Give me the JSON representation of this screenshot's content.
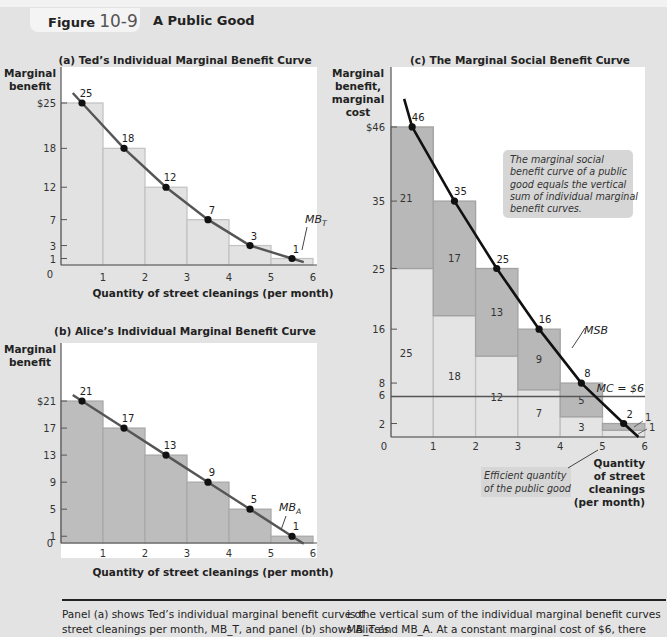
{
  "header": {
    "figure_label": "Figure",
    "figure_number": "10-9",
    "figure_title": "A Public Good"
  },
  "chart_data": [
    {
      "id": "a",
      "type": "bar",
      "title": "(a) Ted’s Individual Marginal Benefit Curve",
      "ylabel": "Marginal benefit",
      "xlabel": "Quantity of street cleanings (per month)",
      "categories": [
        "1",
        "2",
        "3",
        "4",
        "5",
        "6"
      ],
      "x_ticks": [
        0,
        1,
        2,
        3,
        4,
        5,
        6
      ],
      "y_ticks": [
        "$25",
        "18",
        "12",
        "7",
        "3",
        "1"
      ],
      "values": [
        25,
        18,
        12,
        7,
        3,
        1
      ],
      "curve_label": "MB_T",
      "ylim": [
        0,
        28
      ],
      "xlim": [
        0,
        6
      ]
    },
    {
      "id": "b",
      "type": "bar",
      "title": "(b) Alice’s Individual Marginal Benefit Curve",
      "ylabel": "Marginal benefit",
      "xlabel": "Quantity of street cleanings (per month)",
      "categories": [
        "1",
        "2",
        "3",
        "4",
        "5",
        "6"
      ],
      "x_ticks": [
        0,
        1,
        2,
        3,
        4,
        5,
        6
      ],
      "y_ticks": [
        "$21",
        "17",
        "13",
        "9",
        "5",
        "1"
      ],
      "values": [
        21,
        17,
        13,
        9,
        5,
        1
      ],
      "curve_label": "MB_A",
      "ylim": [
        0,
        30
      ],
      "xlim": [
        0,
        6
      ]
    },
    {
      "id": "c",
      "type": "bar",
      "title": "(c) The Marginal Social Benefit Curve",
      "ylabel": "Marginal benefit, marginal cost",
      "xlabel": "Quantity of street cleanings (per month)",
      "categories": [
        "1",
        "2",
        "3",
        "4",
        "5",
        "6"
      ],
      "x_ticks": [
        0,
        1,
        2,
        3,
        4,
        5,
        6
      ],
      "y_ticks": [
        "$46",
        "35",
        "25",
        "16",
        "8",
        "6",
        "2"
      ],
      "series": [
        {
          "name": "Ted (MB_T)",
          "values": [
            25,
            18,
            12,
            7,
            3,
            1
          ]
        },
        {
          "name": "Alice (MB_A)",
          "values": [
            21,
            17,
            13,
            9,
            5,
            1
          ]
        },
        {
          "name": "MSB",
          "values": [
            46,
            35,
            25,
            16,
            8,
            2
          ]
        }
      ],
      "mc_line": {
        "label": "MC = $6",
        "value": 6
      },
      "curve_label": "MSB",
      "annotations": [
        "The marginal social benefit curve of a public good equals the vertical sum of individual marginal benefit curves.",
        "Efficient quantity of the public good"
      ],
      "efficient_quantity": 5,
      "ylim": [
        0,
        55
      ],
      "xlim": [
        0,
        6
      ]
    }
  ],
  "caption": {
    "left_line1": "Panel (a) shows Ted’s individual marginal benefit curve of",
    "left_line2": "street cleanings per month, MB_T, and panel (b) shows Alice’s",
    "right_line1": "is the vertical sum of the individual marginal benefit curves",
    "right_line2": "MB_T and MB_A. At a constant marginal cost of $6, there"
  }
}
